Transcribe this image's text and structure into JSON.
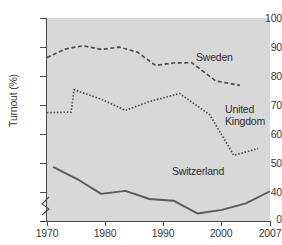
{
  "chart_data": {
    "type": "line",
    "title": "",
    "xlabel": "",
    "ylabel": "Turnout (%)",
    "xlim": [
      1970,
      2007
    ],
    "ylim": [
      40,
      100
    ],
    "y_axis_break": true,
    "grid": false,
    "legend_position": "inline-annotations",
    "x_ticks": [
      1970,
      1980,
      1990,
      2000,
      2007
    ],
    "x_tick_labels": [
      "1970",
      "1980",
      "1990",
      "2000",
      "2007"
    ],
    "y_ticks": [
      0,
      40,
      50,
      60,
      70,
      80,
      90,
      100
    ],
    "y_tick_labels": [
      "0",
      "40",
      "50",
      "60",
      "70",
      "80",
      "90",
      "100"
    ],
    "series": [
      {
        "name": "Sweden",
        "style": "dashed",
        "color": "#4d4d4d",
        "x": [
          1970,
          1973,
          1976,
          1979,
          1982,
          1985,
          1988,
          1991,
          1994,
          1998,
          2002
        ],
        "values": [
          88.3,
          90.8,
          91.8,
          90.7,
          91.4,
          89.9,
          86.0,
          86.7,
          86.8,
          81.4,
          80.1
        ]
      },
      {
        "name": "United Kingdom",
        "style": "dotted",
        "color": "#4d4d4d",
        "x": [
          1970,
          1974,
          1974.5,
          1979,
          1983,
          1987,
          1992,
          1997,
          2001,
          2005
        ],
        "values": [
          72.0,
          72.2,
          78.8,
          76.0,
          72.7,
          75.3,
          77.7,
          71.4,
          59.4,
          61.4
        ]
      },
      {
        "name": "Switzerland",
        "style": "solid",
        "color": "#595959",
        "x": [
          1971,
          1975,
          1979,
          1983,
          1987,
          1991,
          1995,
          1999,
          2003,
          2007
        ],
        "values": [
          56.0,
          52.4,
          48.0,
          48.9,
          46.5,
          46.0,
          42.2,
          43.3,
          45.2,
          48.8
        ]
      }
    ],
    "annotations": [
      {
        "text": "Sweden",
        "series": "Sweden"
      },
      {
        "text": "United\nKingdom",
        "series": "United Kingdom"
      },
      {
        "text": "Switzerland",
        "series": "Switzerland"
      }
    ],
    "colors": {
      "panel_background": "#d8d8d8",
      "axis": "#4a4a4a",
      "text": "#3a3a3a"
    }
  },
  "axis": {
    "y_title": "Turnout (%)",
    "y_labels": {
      "t100": "100",
      "t90": "90",
      "t80": "80",
      "t70": "70",
      "t60": "60",
      "t50": "50",
      "t40": "40",
      "t0": "0"
    },
    "x_labels": {
      "t1970": "1970",
      "t1980": "1980",
      "t1990": "1990",
      "t2000": "2000",
      "t2007": "2007"
    }
  },
  "labels": {
    "sweden": "Sweden",
    "united_kingdom": "United\nKingdom",
    "switzerland": "Switzerland"
  }
}
